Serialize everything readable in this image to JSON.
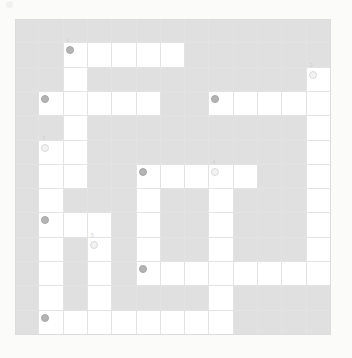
{
  "puzzle": {
    "title": "Crossword grid",
    "grid_size": {
      "rows": 13,
      "cols": 13
    },
    "colors": {
      "page_background": "#fbfbfa",
      "blocked_cell": "#e0e0e0",
      "open_cell": "#ffffff",
      "grid_line": "#e3e3e3",
      "grid_border": "#dcdcdc",
      "marker_dark": "#b4b4b4",
      "marker_light": "#f3f3f3",
      "marker_number_text": "#cfcfcf"
    },
    "open_cells": [
      {
        "row": 1,
        "col": 2
      },
      {
        "row": 1,
        "col": 3
      },
      {
        "row": 1,
        "col": 4
      },
      {
        "row": 1,
        "col": 5
      },
      {
        "row": 1,
        "col": 6
      },
      {
        "row": 2,
        "col": 2
      },
      {
        "row": 2,
        "col": 12
      },
      {
        "row": 3,
        "col": 1
      },
      {
        "row": 3,
        "col": 2
      },
      {
        "row": 3,
        "col": 3
      },
      {
        "row": 3,
        "col": 4
      },
      {
        "row": 3,
        "col": 5
      },
      {
        "row": 3,
        "col": 8
      },
      {
        "row": 3,
        "col": 9
      },
      {
        "row": 3,
        "col": 10
      },
      {
        "row": 3,
        "col": 11
      },
      {
        "row": 3,
        "col": 12
      },
      {
        "row": 4,
        "col": 2
      },
      {
        "row": 4,
        "col": 12
      },
      {
        "row": 5,
        "col": 1
      },
      {
        "row": 5,
        "col": 2
      },
      {
        "row": 5,
        "col": 12
      },
      {
        "row": 6,
        "col": 1
      },
      {
        "row": 6,
        "col": 2
      },
      {
        "row": 6,
        "col": 5
      },
      {
        "row": 6,
        "col": 6
      },
      {
        "row": 6,
        "col": 7
      },
      {
        "row": 6,
        "col": 8
      },
      {
        "row": 6,
        "col": 9
      },
      {
        "row": 6,
        "col": 12
      },
      {
        "row": 7,
        "col": 1
      },
      {
        "row": 7,
        "col": 5
      },
      {
        "row": 7,
        "col": 8
      },
      {
        "row": 7,
        "col": 12
      },
      {
        "row": 8,
        "col": 1
      },
      {
        "row": 8,
        "col": 2
      },
      {
        "row": 8,
        "col": 3
      },
      {
        "row": 8,
        "col": 5
      },
      {
        "row": 8,
        "col": 8
      },
      {
        "row": 8,
        "col": 12
      },
      {
        "row": 9,
        "col": 1
      },
      {
        "row": 9,
        "col": 3
      },
      {
        "row": 9,
        "col": 5
      },
      {
        "row": 9,
        "col": 8
      },
      {
        "row": 9,
        "col": 12
      },
      {
        "row": 10,
        "col": 1
      },
      {
        "row": 10,
        "col": 3
      },
      {
        "row": 10,
        "col": 5
      },
      {
        "row": 10,
        "col": 6
      },
      {
        "row": 10,
        "col": 7
      },
      {
        "row": 10,
        "col": 8
      },
      {
        "row": 10,
        "col": 9
      },
      {
        "row": 10,
        "col": 10
      },
      {
        "row": 10,
        "col": 11
      },
      {
        "row": 10,
        "col": 12
      },
      {
        "row": 11,
        "col": 1
      },
      {
        "row": 11,
        "col": 3
      },
      {
        "row": 11,
        "col": 8
      },
      {
        "row": 12,
        "col": 1
      },
      {
        "row": 12,
        "col": 2
      },
      {
        "row": 12,
        "col": 3
      },
      {
        "row": 12,
        "col": 4
      },
      {
        "row": 12,
        "col": 5
      },
      {
        "row": 12,
        "col": 6
      },
      {
        "row": 12,
        "col": 7
      },
      {
        "row": 12,
        "col": 8
      }
    ],
    "markers": [
      {
        "row": 1,
        "col": 2,
        "style": "dark",
        "label": "",
        "number": "1"
      },
      {
        "row": 2,
        "col": 12,
        "style": "light",
        "label": "",
        "number": "2"
      },
      {
        "row": 3,
        "col": 1,
        "style": "dark",
        "label": "",
        "number": ""
      },
      {
        "row": 3,
        "col": 8,
        "style": "dark",
        "label": "",
        "number": ""
      },
      {
        "row": 5,
        "col": 1,
        "style": "light",
        "label": "",
        "number": "3"
      },
      {
        "row": 6,
        "col": 5,
        "style": "dark",
        "label": "",
        "number": ""
      },
      {
        "row": 6,
        "col": 8,
        "style": "light",
        "label": "",
        "number": "4"
      },
      {
        "row": 8,
        "col": 1,
        "style": "dark",
        "label": "",
        "number": ""
      },
      {
        "row": 9,
        "col": 3,
        "style": "light",
        "label": "",
        "number": "5"
      },
      {
        "row": 10,
        "col": 5,
        "style": "dark",
        "label": "",
        "number": ""
      },
      {
        "row": 12,
        "col": 1,
        "style": "dark",
        "label": "",
        "number": ""
      }
    ]
  }
}
